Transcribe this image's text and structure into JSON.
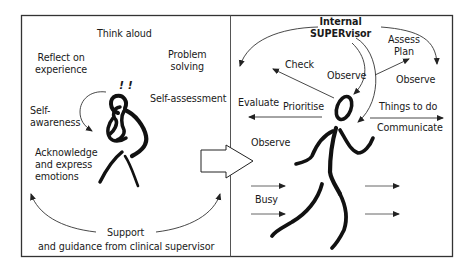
{
  "colors": {
    "ink": "#111111",
    "frame": "#333333",
    "arrow": "#444444",
    "background": "#ffffff"
  },
  "left_panel": {
    "labels": {
      "think_aloud": "Think aloud",
      "reflect": "Reflect on\nexperience",
      "problem_solving": "Problem\nsolving",
      "exclaim": "! !",
      "self_assessment": "Self-assessment",
      "self_awareness": "Self-\nawareness",
      "acknowledge": "Acknowledge\nand express\nemotions",
      "support_line1": "Support",
      "support_line2": "and guidance from clinical supervisor"
    },
    "icons": [
      "thinking-figure-icon",
      "curved-arrow-icon",
      "support-arrow-left-icon",
      "support-arrow-right-icon"
    ]
  },
  "transition": {
    "icon": "block-arrow-right-icon"
  },
  "right_panel": {
    "labels": {
      "internal_supervisor": "Internal\nSUPERvisor",
      "assess_plan": "Assess\nPlan",
      "check": "Check",
      "observe_center": "Observe",
      "observe_right": "Observe",
      "evaluate": "Evaluate",
      "prioritise": "Prioritise",
      "things_to_do": "Things to do",
      "communicate": "Communicate",
      "observe_left": "Observe",
      "busy": "Busy"
    },
    "icons": [
      "running-figure-icon",
      "motion-arrow-icon"
    ]
  }
}
